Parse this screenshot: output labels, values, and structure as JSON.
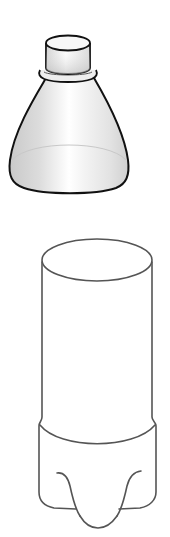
{
  "figure": {
    "caption_cropped": "",
    "parts": [
      {
        "id": "bottle-top",
        "label": "Bottle top (neck with cap)"
      },
      {
        "id": "bottle-bottom",
        "label": "Bottle bottom (body with base)"
      }
    ],
    "colors": {
      "background": "#ffffff",
      "top_outline": "#111111",
      "bottom_outline": "#555555",
      "dome_shade": "#d4d4d4",
      "highlight": "#ffffff",
      "inner_rim": "#c8c8c8"
    }
  }
}
